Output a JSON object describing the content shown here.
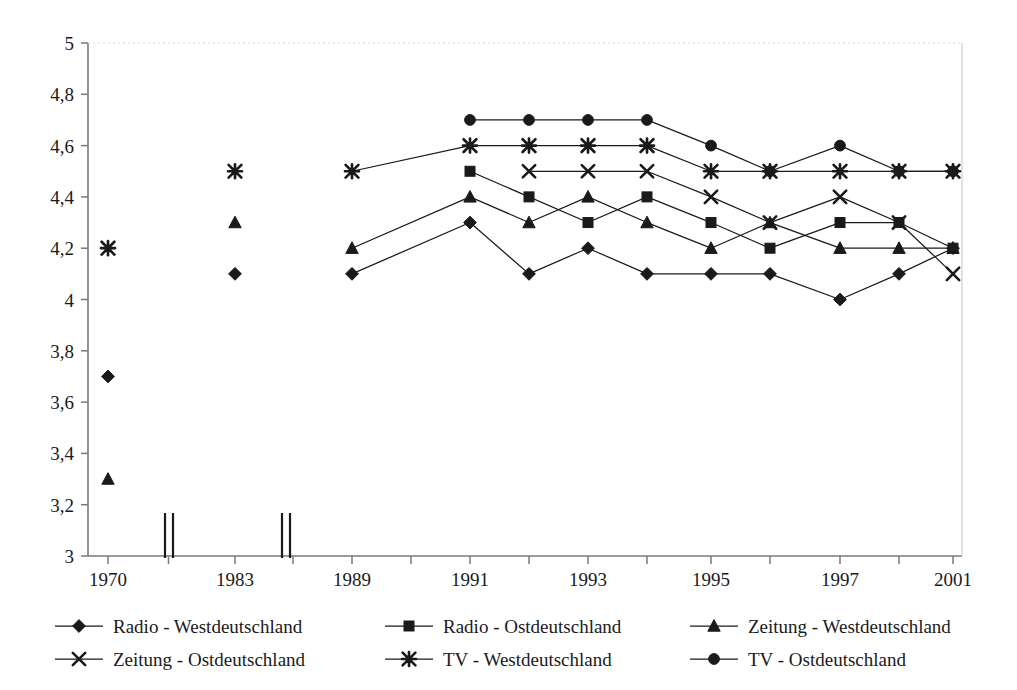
{
  "chart_data": {
    "type": "line",
    "title": "",
    "xlabel": "",
    "ylabel": "",
    "ylim": [
      3,
      5
    ],
    "ytick_step": 0.2,
    "grid": false,
    "legend_position": "bottom",
    "decimal_separator": ",",
    "axis_breaks": [
      "between 1970 and 1983",
      "between 1983 and 1989"
    ],
    "x": [
      "1970",
      "1983",
      "1989",
      "1990",
      "1991",
      "1992",
      "1993",
      "1994",
      "1995",
      "1996",
      "1997",
      "1999",
      "2001"
    ],
    "xtick_labels": [
      "1970",
      "",
      "1983",
      "",
      "1989",
      "",
      "1991",
      "",
      "1993",
      "",
      "1995",
      "",
      "1997",
      "",
      "2001"
    ],
    "xtick_labels_shown": [
      "1970",
      "1983",
      "1989",
      "1991",
      "1993",
      "1995",
      "1997",
      "2001"
    ],
    "ytick_labels": [
      "5",
      "4,8",
      "4,6",
      "4,4",
      "4,2",
      "4",
      "3,8",
      "3,6",
      "3,4",
      "3,2",
      "3"
    ],
    "ytick_values": [
      5,
      4.8,
      4.6,
      4.4,
      4.2,
      4,
      3.8,
      3.6,
      3.4,
      3.2,
      3
    ],
    "series": [
      {
        "name": "Radio - Westdeutschland",
        "marker": "diamond",
        "points": [
          {
            "x": "1970",
            "y": 3.7
          },
          {
            "x": "1983",
            "y": 4.1
          },
          {
            "x": "1989",
            "y": 4.1
          },
          {
            "x": "1991",
            "y": 4.3
          },
          {
            "x": "1992",
            "y": 4.1
          },
          {
            "x": "1993",
            "y": 4.2
          },
          {
            "x": "1994",
            "y": 4.1
          },
          {
            "x": "1995",
            "y": 4.1
          },
          {
            "x": "1996",
            "y": 4.1
          },
          {
            "x": "1997",
            "y": 4.0
          },
          {
            "x": "1999",
            "y": 4.1
          },
          {
            "x": "2001",
            "y": 4.2
          }
        ]
      },
      {
        "name": "Radio - Ostdeutschland",
        "marker": "square",
        "points": [
          {
            "x": "1991",
            "y": 4.5
          },
          {
            "x": "1992",
            "y": 4.4
          },
          {
            "x": "1993",
            "y": 4.3
          },
          {
            "x": "1994",
            "y": 4.4
          },
          {
            "x": "1995",
            "y": 4.3
          },
          {
            "x": "1996",
            "y": 4.2
          },
          {
            "x": "1997",
            "y": 4.3
          },
          {
            "x": "1999",
            "y": 4.3
          },
          {
            "x": "2001",
            "y": 4.2
          }
        ]
      },
      {
        "name": "Zeitung - Westdeutschland",
        "marker": "triangle",
        "points": [
          {
            "x": "1970",
            "y": 3.3
          },
          {
            "x": "1983",
            "y": 4.3
          },
          {
            "x": "1989",
            "y": 4.2
          },
          {
            "x": "1991",
            "y": 4.4
          },
          {
            "x": "1992",
            "y": 4.3
          },
          {
            "x": "1993",
            "y": 4.4
          },
          {
            "x": "1994",
            "y": 4.3
          },
          {
            "x": "1995",
            "y": 4.2
          },
          {
            "x": "1996",
            "y": 4.3
          },
          {
            "x": "1997",
            "y": 4.2
          },
          {
            "x": "1999",
            "y": 4.2
          },
          {
            "x": "2001",
            "y": 4.2
          }
        ]
      },
      {
        "name": "Zeitung - Ostdeutschland",
        "marker": "cross",
        "points": [
          {
            "x": "1992",
            "y": 4.5
          },
          {
            "x": "1993",
            "y": 4.5
          },
          {
            "x": "1994",
            "y": 4.5
          },
          {
            "x": "1995",
            "y": 4.4
          },
          {
            "x": "1996",
            "y": 4.3
          },
          {
            "x": "1997",
            "y": 4.4
          },
          {
            "x": "1999",
            "y": 4.3
          },
          {
            "x": "2001",
            "y": 4.1
          }
        ]
      },
      {
        "name": "TV - Westdeutschland",
        "marker": "star",
        "points": [
          {
            "x": "1970",
            "y": 4.2
          },
          {
            "x": "1983",
            "y": 4.5
          },
          {
            "x": "1989",
            "y": 4.5
          },
          {
            "x": "1991",
            "y": 4.6
          },
          {
            "x": "1992",
            "y": 4.6
          },
          {
            "x": "1993",
            "y": 4.6
          },
          {
            "x": "1994",
            "y": 4.6
          },
          {
            "x": "1995",
            "y": 4.5
          },
          {
            "x": "1996",
            "y": 4.5
          },
          {
            "x": "1997",
            "y": 4.5
          },
          {
            "x": "1999",
            "y": 4.5
          },
          {
            "x": "2001",
            "y": 4.5
          }
        ]
      },
      {
        "name": "TV - Ostdeutschland",
        "marker": "circle",
        "points": [
          {
            "x": "1991",
            "y": 4.7
          },
          {
            "x": "1992",
            "y": 4.7
          },
          {
            "x": "1993",
            "y": 4.7
          },
          {
            "x": "1994",
            "y": 4.7
          },
          {
            "x": "1995",
            "y": 4.6
          },
          {
            "x": "1996",
            "y": 4.5
          },
          {
            "x": "1997",
            "y": 4.6
          },
          {
            "x": "1999",
            "y": 4.5
          },
          {
            "x": "2001",
            "y": 4.5
          }
        ]
      }
    ]
  },
  "legend": {
    "items": [
      {
        "label": "Radio - Westdeutschland",
        "marker": "diamond"
      },
      {
        "label": "Radio - Ostdeutschland",
        "marker": "square"
      },
      {
        "label": "Zeitung - Westdeutschland",
        "marker": "triangle"
      },
      {
        "label": "Zeitung - Ostdeutschland",
        "marker": "cross"
      },
      {
        "label": "TV - Westdeutschland",
        "marker": "star"
      },
      {
        "label": "TV - Ostdeutschland",
        "marker": "circle"
      }
    ]
  },
  "colors": {
    "line": "#1a1a1a",
    "axis": "#7a7a7a",
    "text": "#1a1a1a",
    "background": "#ffffff"
  }
}
